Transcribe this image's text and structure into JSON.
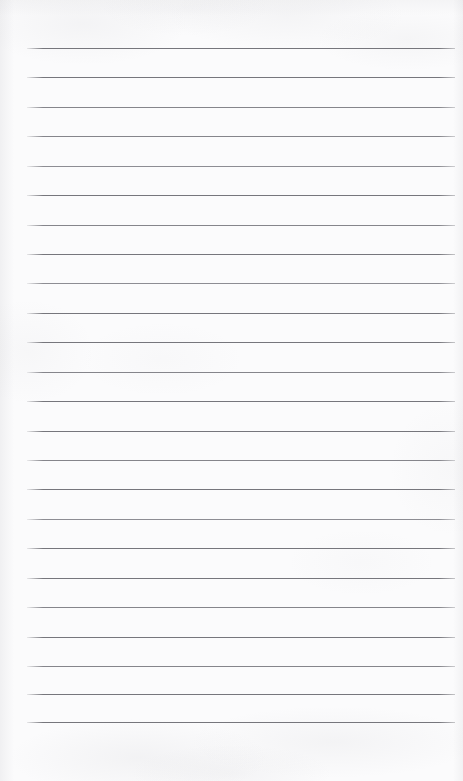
{
  "document": {
    "kind": "scanned-blank-ruled-page",
    "description": "Blank lined notebook page, scanned",
    "has_text_content": false,
    "text_content": "",
    "page_width": 463,
    "page_height": 781
  },
  "appearance": {
    "background_color": "#fbfbfc",
    "rule_color": "#7e7e84",
    "rule_color_light": "#8d8d93",
    "rule_color_dark": "#76767c",
    "paper_tone": "off-white"
  },
  "ruling": {
    "line_count": 24,
    "line_thickness_px": 1,
    "line_spacing_px": 29.3,
    "first_line_y": 48,
    "last_line_y": 722,
    "left_margin_x": 27,
    "right_end_x": 455,
    "top_blank_px": 48,
    "bottom_blank_px": 59,
    "lines": [
      {
        "index": 1,
        "y": 48,
        "x1": 27,
        "x2": 455,
        "ink": "ink-a"
      },
      {
        "index": 2,
        "y": 77,
        "x1": 27,
        "x2": 455,
        "ink": "ink-a"
      },
      {
        "index": 3,
        "y": 107,
        "x1": 27,
        "x2": 455,
        "ink": "ink-b"
      },
      {
        "index": 4,
        "y": 136,
        "x1": 27,
        "x2": 455,
        "ink": "ink-b"
      },
      {
        "index": 5,
        "y": 166,
        "x1": 27,
        "x2": 455,
        "ink": "ink-c"
      },
      {
        "index": 6,
        "y": 195,
        "x1": 27,
        "x2": 455,
        "ink": "ink-a"
      },
      {
        "index": 7,
        "y": 225,
        "x1": 27,
        "x2": 455,
        "ink": "ink-b"
      },
      {
        "index": 8,
        "y": 254,
        "x1": 27,
        "x2": 455,
        "ink": "ink-a"
      },
      {
        "index": 9,
        "y": 283,
        "x1": 27,
        "x2": 455,
        "ink": "ink-c"
      },
      {
        "index": 10,
        "y": 313,
        "x1": 27,
        "x2": 455,
        "ink": "ink-a"
      },
      {
        "index": 11,
        "y": 342,
        "x1": 27,
        "x2": 455,
        "ink": "ink-a"
      },
      {
        "index": 12,
        "y": 372,
        "x1": 27,
        "x2": 455,
        "ink": "ink-b"
      },
      {
        "index": 13,
        "y": 401,
        "x1": 27,
        "x2": 455,
        "ink": "ink-a"
      },
      {
        "index": 14,
        "y": 431,
        "x1": 27,
        "x2": 455,
        "ink": "ink-a"
      },
      {
        "index": 15,
        "y": 460,
        "x1": 27,
        "x2": 455,
        "ink": "ink-b"
      },
      {
        "index": 16,
        "y": 489,
        "x1": 27,
        "x2": 455,
        "ink": "ink-a"
      },
      {
        "index": 17,
        "y": 519,
        "x1": 27,
        "x2": 455,
        "ink": "ink-c"
      },
      {
        "index": 18,
        "y": 548,
        "x1": 27,
        "x2": 455,
        "ink": "ink-a"
      },
      {
        "index": 19,
        "y": 578,
        "x1": 27,
        "x2": 455,
        "ink": "ink-a"
      },
      {
        "index": 20,
        "y": 607,
        "x1": 27,
        "x2": 455,
        "ink": "ink-b"
      },
      {
        "index": 21,
        "y": 637,
        "x1": 27,
        "x2": 455,
        "ink": "ink-a"
      },
      {
        "index": 22,
        "y": 666,
        "x1": 27,
        "x2": 455,
        "ink": "ink-b"
      },
      {
        "index": 23,
        "y": 694,
        "x1": 27,
        "x2": 455,
        "ink": "ink-a"
      },
      {
        "index": 24,
        "y": 722,
        "x1": 27,
        "x2": 455,
        "ink": "ink-a"
      }
    ]
  }
}
